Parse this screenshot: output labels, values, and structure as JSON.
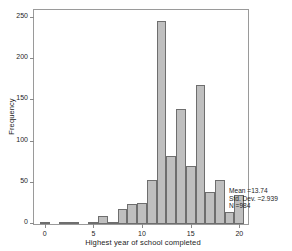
{
  "chart_data": {
    "type": "bar",
    "title": "",
    "xlabel": "Highest year of school completed",
    "ylabel": "Frequency",
    "categories": [
      0,
      1,
      2,
      3,
      4,
      5,
      6,
      7,
      8,
      9,
      10,
      11,
      12,
      13,
      14,
      15,
      16,
      17,
      18,
      19,
      20
    ],
    "values": [
      1,
      0,
      2,
      1,
      0,
      2,
      10,
      3,
      18,
      24,
      25,
      53,
      246,
      83,
      139,
      70,
      169,
      39,
      53,
      15,
      35
    ],
    "xlim": [
      -1.1,
      21.1
    ],
    "ylim": [
      0,
      262
    ],
    "xticks": [
      0,
      5,
      10,
      15,
      20
    ],
    "xtick_labels": [
      "0",
      "5",
      "10",
      "15",
      "20"
    ],
    "yticks": [
      0,
      50,
      100,
      150,
      200,
      250
    ],
    "ytick_labels": [
      "0",
      "50",
      "100",
      "150",
      "200",
      "250"
    ],
    "grid": false,
    "legend": "none",
    "bar_fill_color": "#bfbfbf",
    "bar_edge_color": "#6e6e6e",
    "frame_color": "#9a9a9a",
    "background_color": "#ffffff"
  },
  "annotations": {
    "mean": "Mean =13.74",
    "std_dev": "Std. Dev. =2.939",
    "n": "N =984"
  }
}
